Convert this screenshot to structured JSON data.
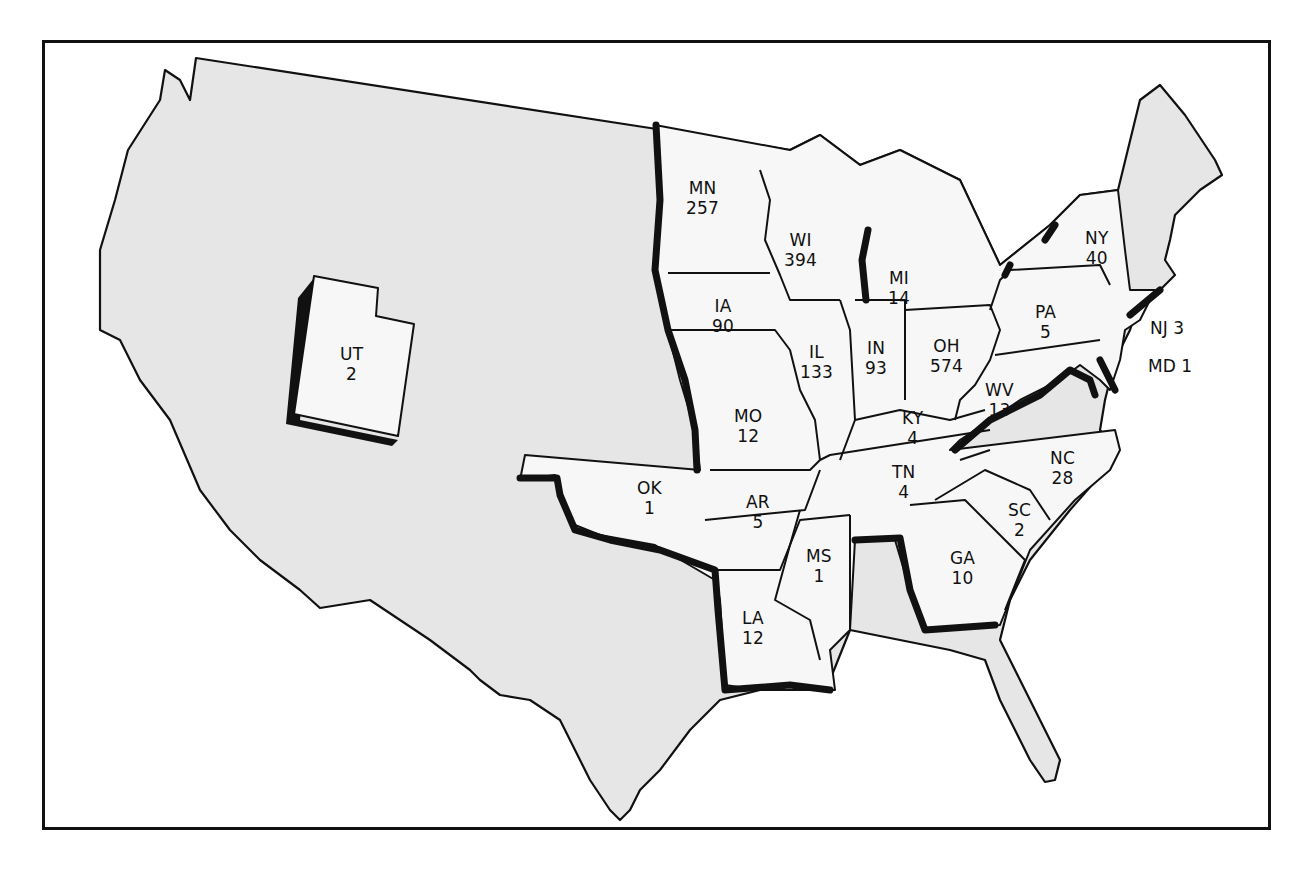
{
  "map": {
    "type": "choropleth-outline",
    "region": "United States (contiguous)",
    "colors": {
      "background": "#ffffff",
      "land": "#e6e6e6",
      "highlighted_state": "#f7f7f7",
      "border": "#111111"
    }
  },
  "states": [
    {
      "abbr": "MN",
      "value": "257"
    },
    {
      "abbr": "WI",
      "value": "394"
    },
    {
      "abbr": "MI",
      "value": "14"
    },
    {
      "abbr": "IA",
      "value": "90"
    },
    {
      "abbr": "IL",
      "value": "133"
    },
    {
      "abbr": "IN",
      "value": "93"
    },
    {
      "abbr": "OH",
      "value": "574"
    },
    {
      "abbr": "NY",
      "value": "40"
    },
    {
      "abbr": "PA",
      "value": "5"
    },
    {
      "abbr": "WV",
      "value": "13"
    },
    {
      "abbr": "KY",
      "value": "4"
    },
    {
      "abbr": "MO",
      "value": "12"
    },
    {
      "abbr": "TN",
      "value": "4"
    },
    {
      "abbr": "NC",
      "value": "28"
    },
    {
      "abbr": "SC",
      "value": "2"
    },
    {
      "abbr": "GA",
      "value": "10"
    },
    {
      "abbr": "AR",
      "value": "5"
    },
    {
      "abbr": "OK",
      "value": "1"
    },
    {
      "abbr": "MS",
      "value": "1"
    },
    {
      "abbr": "LA",
      "value": "12"
    },
    {
      "abbr": "UT",
      "value": "2"
    }
  ],
  "side_labels": [
    {
      "text": "NJ 3"
    },
    {
      "text": "MD 1"
    }
  ]
}
